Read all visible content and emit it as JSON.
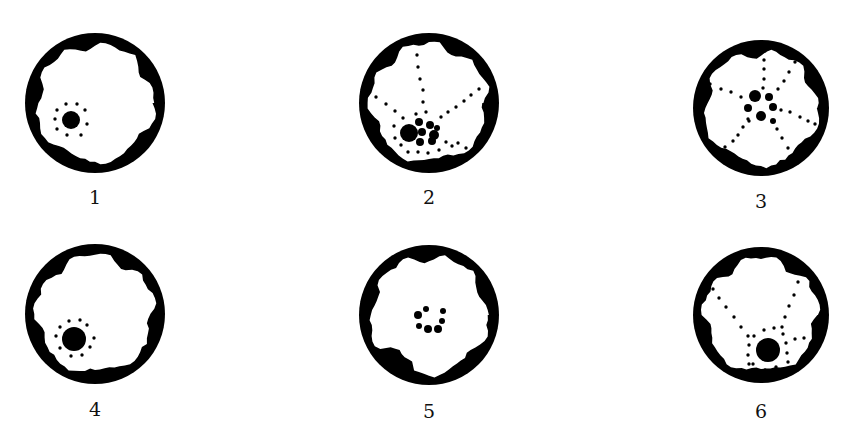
{
  "figure": {
    "panels": [
      {
        "label": "1",
        "cx": 95,
        "cy": 103,
        "r": 70,
        "labelY": 186,
        "nuclei": [
          {
            "x": 71,
            "y": 120,
            "r": 9
          }
        ],
        "dots": [
          [
            66,
            104
          ],
          [
            77,
            104
          ],
          [
            57,
            110
          ],
          [
            85,
            110
          ],
          [
            55,
            119
          ],
          [
            87,
            124
          ],
          [
            57,
            129
          ],
          [
            67,
            135
          ],
          [
            81,
            135
          ]
        ],
        "blobs": "top-left-right"
      },
      {
        "label": "2",
        "cx": 429,
        "cy": 103,
        "r": 70,
        "labelY": 186,
        "nuclei": [
          {
            "x": 409,
            "y": 133,
            "r": 9
          },
          {
            "x": 419,
            "y": 122,
            "r": 4
          },
          {
            "x": 430,
            "y": 125,
            "r": 4
          },
          {
            "x": 422,
            "y": 132,
            "r": 4
          },
          {
            "x": 434,
            "y": 135,
            "r": 5
          },
          {
            "x": 420,
            "y": 142,
            "r": 4
          },
          {
            "x": 432,
            "y": 141,
            "r": 4
          },
          {
            "x": 437,
            "y": 128,
            "r": 3
          }
        ],
        "dots": [
          [
            417,
            55
          ],
          [
            418,
            67
          ],
          [
            420,
            79
          ],
          [
            423,
            90
          ],
          [
            423,
            102
          ],
          [
            416,
            114
          ],
          [
            426,
            112
          ],
          [
            376,
            97
          ],
          [
            386,
            104
          ],
          [
            395,
            111
          ],
          [
            403,
            118
          ],
          [
            479,
            89
          ],
          [
            471,
            95
          ],
          [
            464,
            101
          ],
          [
            456,
            107
          ],
          [
            448,
            112
          ],
          [
            441,
            117
          ],
          [
            394,
            126
          ],
          [
            395,
            138
          ],
          [
            401,
            145
          ],
          [
            408,
            152
          ],
          [
            418,
            152
          ],
          [
            428,
            153
          ],
          [
            439,
            150
          ],
          [
            446,
            142
          ],
          [
            452,
            146
          ],
          [
            458,
            143
          ],
          [
            466,
            148
          ]
        ],
        "blobs": "mixed"
      },
      {
        "label": "3",
        "cx": 761,
        "cy": 108,
        "r": 68,
        "labelY": 190,
        "nuclei": [
          {
            "x": 755,
            "y": 96,
            "r": 6
          },
          {
            "x": 769,
            "y": 97,
            "r": 4
          },
          {
            "x": 748,
            "y": 108,
            "r": 4
          },
          {
            "x": 773,
            "y": 107,
            "r": 4
          },
          {
            "x": 761,
            "y": 116,
            "r": 5
          },
          {
            "x": 773,
            "y": 121,
            "r": 3
          }
        ],
        "dots": [
          [
            765,
            51
          ],
          [
            764,
            60
          ],
          [
            764,
            69
          ],
          [
            764,
            79
          ],
          [
            763,
            88
          ],
          [
            795,
            62
          ],
          [
            789,
            72
          ],
          [
            784,
            81
          ],
          [
            778,
            89
          ],
          [
            710,
            84
          ],
          [
            721,
            89
          ],
          [
            731,
            92
          ],
          [
            741,
            97
          ],
          [
            781,
            110
          ],
          [
            790,
            112
          ],
          [
            800,
            117
          ],
          [
            808,
            121
          ],
          [
            815,
            124
          ],
          [
            748,
            119
          ],
          [
            743,
            127
          ],
          [
            738,
            135
          ],
          [
            733,
            141
          ],
          [
            725,
            147
          ],
          [
            777,
            129
          ],
          [
            782,
            138
          ],
          [
            788,
            148
          ],
          [
            749,
            121
          ]
        ],
        "blobs": "mixed"
      },
      {
        "label": "4",
        "cx": 95,
        "cy": 314,
        "r": 70,
        "labelY": 398,
        "nuclei": [
          {
            "x": 74,
            "y": 339,
            "r": 12
          }
        ],
        "dots": [
          [
            69,
            321
          ],
          [
            80,
            320
          ],
          [
            60,
            327
          ],
          [
            87,
            325
          ],
          [
            56,
            336
          ],
          [
            94,
            338
          ],
          [
            60,
            348
          ],
          [
            90,
            347
          ],
          [
            71,
            356
          ],
          [
            82,
            355
          ]
        ],
        "blobs": "top-left-right"
      },
      {
        "label": "5",
        "cx": 429,
        "cy": 315,
        "r": 70,
        "labelY": 400,
        "nuclei": [
          {
            "x": 418,
            "y": 315,
            "r": 4
          },
          {
            "x": 426,
            "y": 309,
            "r": 3
          },
          {
            "x": 443,
            "y": 311,
            "r": 3
          },
          {
            "x": 442,
            "y": 321,
            "r": 3
          },
          {
            "x": 419,
            "y": 326,
            "r": 3
          },
          {
            "x": 428,
            "y": 329,
            "r": 4
          },
          {
            "x": 438,
            "y": 329,
            "r": 4
          }
        ],
        "dots": [],
        "blobs": "bottom-left"
      },
      {
        "label": "6",
        "cx": 761,
        "cy": 315,
        "r": 68,
        "labelY": 400,
        "nuclei": [
          {
            "x": 768,
            "y": 350,
            "r": 12
          }
        ],
        "dots": [
          [
            713,
            289
          ],
          [
            719,
            298
          ],
          [
            726,
            307
          ],
          [
            734,
            317
          ],
          [
            741,
            327
          ],
          [
            798,
            282
          ],
          [
            794,
            295
          ],
          [
            789,
            306
          ],
          [
            785,
            317
          ],
          [
            782,
            327
          ],
          [
            764,
            330
          ],
          [
            774,
            328
          ],
          [
            783,
            334
          ],
          [
            748,
            336
          ],
          [
            754,
            336
          ],
          [
            749,
            345
          ],
          [
            748,
            355
          ],
          [
            749,
            364
          ],
          [
            745,
            372
          ],
          [
            753,
            364
          ],
          [
            786,
            343
          ],
          [
            795,
            339
          ],
          [
            804,
            338
          ],
          [
            787,
            353
          ],
          [
            788,
            362
          ],
          [
            785,
            372
          ],
          [
            776,
            367
          ],
          [
            765,
            370
          ],
          [
            738,
            371
          ],
          [
            782,
            374
          ],
          [
            790,
            374
          ]
        ],
        "blobs": "mixed"
      }
    ]
  }
}
